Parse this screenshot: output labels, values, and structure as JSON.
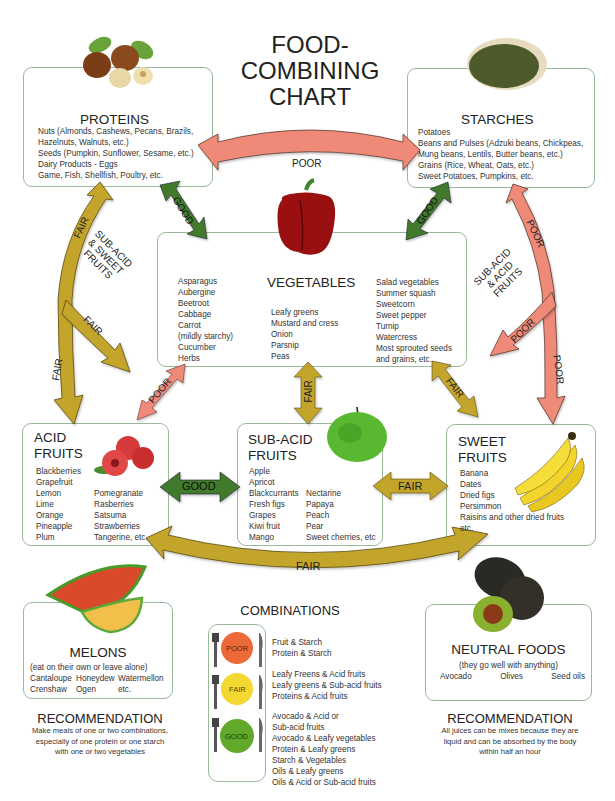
{
  "title": [
    "FOOD-COMBINING",
    "CHART"
  ],
  "colors": {
    "poor": "#f08a78",
    "fair": "#c2a52c",
    "good": "#3f7a2c",
    "box_border": "#9bb89b"
  },
  "proteins": {
    "heading": "PROTEINS",
    "icon": "hazelnuts-icon",
    "items": [
      "Nuts (Almonds, Cashews, Pecans, Brazils,",
      "Hazelnuts, Walnuts, etc.)",
      "Seeds (Pumpkin, Sunflower, Sesame, etc.)",
      "Dairy Products - Eggs",
      "Game, Fish, Shellfish, Poultry, etc."
    ]
  },
  "starches": {
    "heading": "STARCHES",
    "icon": "bread-icon",
    "items": [
      "Potatoes",
      "Beans and Pulses (Adzuki beans, Chickpeas,",
      "Mung beans, Lentils, Butter beans, etc.)",
      "Grains (Rice, Wheat, Oats, etc.)",
      "Sweet Potatoes, Pumpkins, etc."
    ]
  },
  "vegetables": {
    "heading": "VEGETABLES",
    "icon": "bell-pepper-icon",
    "col1": [
      "Asparagus",
      "Aubergine",
      "Beetroot",
      "Cabbage",
      "Carrot",
      "(mildly starchy)",
      "Cucumber",
      "Herbs"
    ],
    "col2": [
      "Leafy greens",
      "Mustard and cress",
      "Onion",
      "Parsnip",
      "Peas"
    ],
    "col3": [
      "Salad vegetables",
      "Summer squash",
      "Sweetcorn",
      "Sweet pepper",
      "Turnip",
      "Watercress",
      "Most sprouted seeds",
      "and grains, etc."
    ]
  },
  "acid_fruits": {
    "heading": [
      "ACID",
      "FRUITS"
    ],
    "icon": "raspberries-icon",
    "col1": [
      "Blackberries",
      "Grapefruit",
      "Lemon",
      "Lime",
      "Orange",
      "Pineapple",
      "Plum"
    ],
    "col2": [
      "Pomegranate",
      "Rasberries",
      "Satsuma",
      "Strawberries",
      "Tangerine, etc."
    ]
  },
  "subacid_fruits": {
    "heading": [
      "SUB-ACID",
      "FRUITS"
    ],
    "icon": "green-apple-icon",
    "col1": [
      "Apple",
      "Apricot",
      "Blackcurrants",
      "Fresh figs",
      "Grapes",
      "Kiwi fruit",
      "Mango"
    ],
    "col2": [
      "Nectarine",
      "Papaya",
      "Peach",
      "Pear",
      "Sweet cherries, etc"
    ]
  },
  "sweet_fruits": {
    "heading": [
      "SWEET",
      "FRUITS"
    ],
    "icon": "bananas-icon",
    "items": [
      "Banana",
      "Dates",
      "Dried figs",
      "Persimmon",
      "Raisins and other dried fruits",
      "etc."
    ]
  },
  "melons": {
    "heading": "MELONS",
    "icon": "melon-slices-icon",
    "note": "(eat on their own or leave alone)",
    "row1": [
      "Cantaloupe",
      "Honeydew",
      "Watermellon"
    ],
    "row2": [
      "Crenshaw",
      "Ogen",
      "etc."
    ]
  },
  "neutral": {
    "heading": "NEUTRAL FOODS",
    "icon": "avocado-icon",
    "note": "(they go well with anything)",
    "items": [
      "Avocado",
      "Olives",
      "Seed oils"
    ]
  },
  "recommendation_left": {
    "heading": "RECOMMENDATION",
    "lines": [
      "Make meals of one or two combinations,",
      "especially of one protein or one starch",
      "with one or two vegetables"
    ]
  },
  "recommendation_right": {
    "heading": "RECOMMENDATION",
    "lines": [
      "All juices can be mixes because they are",
      "liquid and can be absorbed by the body",
      "within half an hour"
    ]
  },
  "combinations": {
    "heading": "COMBINATIONS",
    "groups": [
      {
        "rating": "POOR",
        "items": [
          "Fruit & Starch",
          "Protein & Starch"
        ]
      },
      {
        "rating": "FAIR",
        "items": [
          "Leafy Freens & Acid fruits",
          "Leafy greens & Sub-acid fruits",
          "Proteins & Acid fruits"
        ]
      },
      {
        "rating": "GOOD",
        "items": [
          "Avocado & Acid or",
          "Sub-acid fruits",
          "Avocado & Leafy vegetables",
          "Protein & Leafy greens",
          "Starch & Vegetables",
          "Oils & Leafy greens",
          "Oils & Acid or Sub-acid fruits"
        ]
      }
    ]
  },
  "arrows": {
    "proteins_starches": "POOR",
    "proteins_vegetables": "GOOD",
    "starches_vegetables": "GOOD",
    "proteins_fruits_upper": "FAIR",
    "proteins_fruits_branch": "FAIR",
    "proteins_fruits_lower": "FAIR",
    "proteins_fruits_group": [
      "SUB-ACID",
      "& SWEET",
      "FRUITS"
    ],
    "starches_fruits_upper": "POOR",
    "starches_fruits_branch": "POOR",
    "starches_fruits_lower": "POOR",
    "starches_fruits_group": [
      "SUB-ACID",
      "& ACID",
      "FRUITS"
    ],
    "vegetables_acid": "POOR",
    "vegetables_subacid": "FAIR",
    "vegetables_sweet": "FAIR",
    "acid_subacid": "GOOD",
    "subacid_sweet": "FAIR",
    "acid_sweet": "FAIR"
  }
}
